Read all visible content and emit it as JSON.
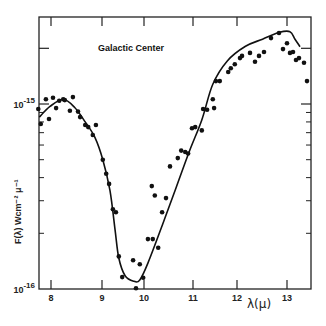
{
  "chart_data": {
    "type": "scatter",
    "title": "Galactic Center",
    "xlabel": "λ(μ)",
    "ylabel": "F(λ)  Wcm⁻²  μ⁻¹",
    "yscale": "log",
    "xlim": [
      7.75,
      13.45
    ],
    "ylim": [
      1e-16,
      3e-15
    ],
    "x_ticks": [
      8,
      9,
      10,
      11,
      12,
      13
    ],
    "x_tick_labels": [
      "8",
      "9",
      "10",
      "11",
      "12",
      "13"
    ],
    "y_major_ticks": [
      1e-16,
      1e-15,
      2e-15
    ],
    "y_tick_labels": [
      {
        "base": "10",
        "exp": "-16",
        "value": 1e-16
      },
      {
        "base": "10",
        "exp": "-15",
        "value": 1e-15
      }
    ],
    "y_minor_ticks": [
      2e-16,
      3e-16,
      4e-16,
      5e-16,
      6e-16,
      7e-16,
      8e-16,
      9e-16
    ],
    "grid": false,
    "legend": null,
    "units_note": "y values in units of 1e-16 W cm^-2 μ^-1",
    "series": [
      {
        "name": "observed points",
        "type": "scatter",
        "x": [
          7.75,
          7.8,
          7.9,
          7.96,
          8.04,
          8.1,
          8.16,
          8.24,
          8.27,
          8.37,
          8.43,
          8.53,
          8.57,
          8.67,
          8.73,
          8.82,
          8.88,
          9.02,
          9.1,
          9.17,
          9.26,
          9.33,
          9.4,
          9.48,
          9.74,
          9.81,
          9.9,
          9.98,
          10.08,
          10.16,
          10.18,
          10.22,
          10.29,
          10.37,
          10.45,
          10.53,
          10.69,
          10.76,
          10.84,
          10.9,
          10.98,
          11.05,
          11.2,
          11.23,
          11.32,
          11.45,
          11.48,
          11.52,
          11.61,
          11.8,
          11.86,
          11.95,
          12.06,
          12.1,
          12.26,
          12.36,
          12.44,
          12.54,
          12.68,
          12.84,
          12.92,
          13.0,
          13.06,
          13.12,
          13.18,
          13.24,
          13.34,
          13.4
        ],
        "y": [
          9.4,
          7.8,
          10.6,
          8.3,
          10.8,
          9.5,
          10.4,
          10.6,
          10.5,
          9.2,
          10.9,
          9.1,
          8.5,
          7.7,
          7.5,
          6.8,
          7.7,
          5.0,
          4.2,
          3.7,
          2.7,
          2.6,
          1.5,
          1.16,
          1.43,
          1.01,
          1.36,
          1.15,
          1.86,
          3.6,
          1.86,
          3.2,
          1.67,
          2.6,
          3.1,
          4.6,
          5.1,
          5.6,
          5.5,
          5.4,
          7.4,
          7.5,
          7.2,
          9.4,
          9.3,
          10.6,
          9.5,
          13.3,
          13.3,
          14.9,
          15.6,
          16.4,
          17.7,
          18.2,
          18.9,
          16.9,
          18.2,
          19.1,
          22.7,
          24.2,
          19.8,
          21.3,
          18.9,
          19.1,
          17.3,
          17.7,
          16.7,
          13.3
        ]
      },
      {
        "name": "model curve",
        "type": "line",
        "x": [
          7.77,
          7.98,
          8.24,
          8.46,
          8.67,
          8.86,
          9.02,
          9.19,
          9.31,
          9.4,
          9.55,
          9.76,
          9.9,
          10.08,
          10.37,
          10.65,
          10.92,
          11.2,
          11.45,
          11.78,
          12.17,
          12.51,
          12.85,
          13.06,
          13.16,
          13.26
        ],
        "y": [
          8.5,
          9.7,
          10.6,
          9.6,
          8.0,
          6.6,
          5.0,
          3.4,
          2.1,
          1.47,
          1.18,
          1.1,
          1.12,
          1.38,
          2.2,
          3.5,
          5.5,
          8.2,
          12.8,
          17.1,
          20.5,
          22.4,
          24.4,
          24.6,
          22.4,
          20.4
        ]
      }
    ]
  },
  "layout_px": {
    "plot_left": 39,
    "plot_right": 311,
    "plot_top": 17,
    "plot_bottom": 289,
    "x_tick_px": [
      51,
      102,
      144,
      193,
      237,
      287
    ],
    "y_decade_px": 185
  }
}
